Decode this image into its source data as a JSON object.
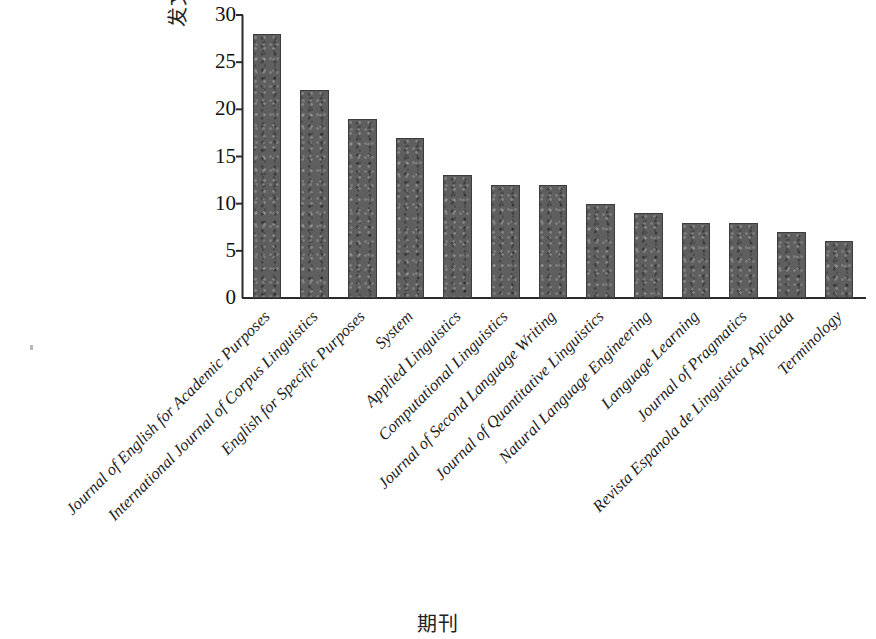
{
  "chart_data": {
    "type": "bar",
    "title": "",
    "xlabel": "期刊",
    "ylabel": "发文量/篇",
    "ylim": [
      0,
      30
    ],
    "yticks": [
      0,
      5,
      10,
      15,
      20,
      25,
      30
    ],
    "ytick_labels": [
      "0",
      "5",
      "10",
      "15",
      "20",
      "25",
      "30"
    ],
    "grid": false,
    "legend": null,
    "bar_color": "#5f5f5f",
    "bar_edge_color": "#3d3d3d",
    "axis_color": "#2b2b2b",
    "xtick_rotation": -45,
    "categories": [
      "Journal of English for Academic Purposes",
      "International Journal of Corpus Linguistics",
      "English for Specific Purposes",
      "System",
      "Applied Linguistics",
      "Computational Linguistics",
      "Journal of Second Language Writing",
      "Journal of Quantitative Linguistics",
      "Natural Language Engineering",
      "Language Learning",
      "Journal of Pragmatics",
      "Revista Espanola de Linguistica Aplicada",
      "Terminology"
    ],
    "values": [
      28,
      22,
      19,
      17,
      13,
      12,
      12,
      10,
      9,
      8,
      8,
      7,
      6
    ]
  }
}
